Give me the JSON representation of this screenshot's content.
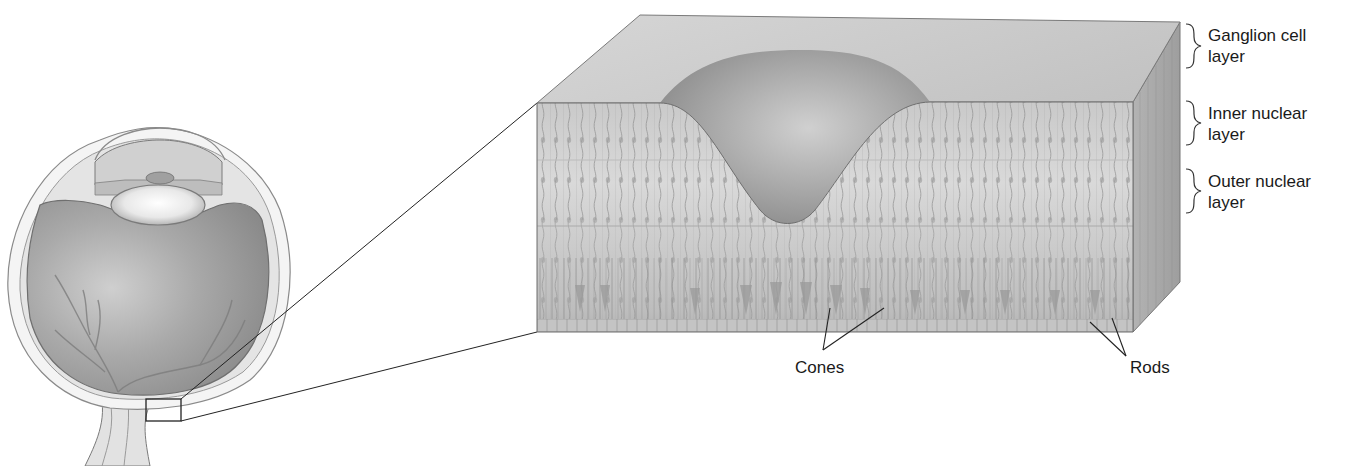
{
  "figure": {
    "colors": {
      "background": "#ffffff",
      "tissue_light": "#d8d8d8",
      "tissue_mid": "#b5b5b5",
      "tissue_dark": "#8f8f8f",
      "line": "#2a2a2a",
      "label_text": "#1a1a1a"
    }
  },
  "eye": {
    "name": "eyeball-cross-section",
    "highlight_box": "fovea-region-box"
  },
  "retina_block": {
    "layers": [
      {
        "id": "ganglion",
        "label_line1": "Ganglion cell",
        "label_line2": "layer"
      },
      {
        "id": "inner",
        "label_line1": "Inner nuclear",
        "label_line2": "layer"
      },
      {
        "id": "outer",
        "label_line1": "Outer nuclear",
        "label_line2": "layer"
      }
    ],
    "callouts": {
      "cones": "Cones",
      "rods": "Rods"
    }
  }
}
